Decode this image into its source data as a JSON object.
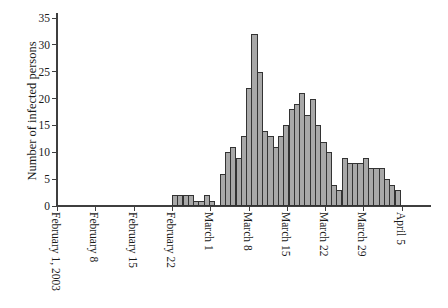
{
  "chart_data": {
    "type": "bar",
    "title": "",
    "ylabel": "Number of infected persons",
    "xlabel": "",
    "ylim": [
      0,
      35
    ],
    "y_ticks": [
      0,
      5,
      10,
      15,
      20,
      25,
      30,
      35
    ],
    "x_tick_labels": [
      "February 1, 2003",
      "February 8",
      "February 15",
      "February 22",
      "March 1",
      "March 8",
      "March 15",
      "March 22",
      "March 29",
      "April 5"
    ],
    "bars_start_at_label": "February 22",
    "values": [
      2,
      2,
      2,
      2,
      1,
      1,
      2,
      1,
      0,
      6,
      10,
      11,
      9,
      13,
      22,
      32,
      25,
      14,
      13,
      11,
      13,
      15,
      18,
      19,
      21,
      17,
      20,
      15,
      12,
      10,
      4,
      3,
      9,
      8,
      8,
      8,
      9,
      7,
      7,
      7,
      5,
      4,
      3
    ],
    "grid": false,
    "legend": false,
    "bar_fill": "#a8a8a8",
    "bar_border": "#333333",
    "axis_color": "#3f3f3f",
    "background": "#ffffff"
  }
}
